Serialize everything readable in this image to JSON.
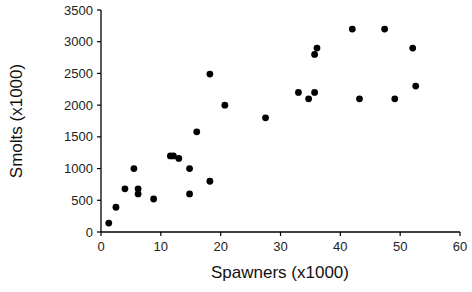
{
  "chart_data": {
    "type": "scatter",
    "title": "",
    "xlabel": "Spawners (x1000)",
    "ylabel": "Smolts (x1000)",
    "xlim": [
      0,
      60
    ],
    "ylim": [
      0,
      3500
    ],
    "xticks": [
      0,
      10,
      20,
      30,
      40,
      50,
      60
    ],
    "yticks": [
      0,
      500,
      1000,
      1500,
      2000,
      2500,
      3000,
      3500
    ],
    "grid": false,
    "legend": null,
    "marker_color": "#000000",
    "series": [
      {
        "name": "Smolts vs Spawners",
        "points": [
          {
            "x": 1.3,
            "y": 140
          },
          {
            "x": 2.5,
            "y": 390
          },
          {
            "x": 4.0,
            "y": 680
          },
          {
            "x": 5.5,
            "y": 1000
          },
          {
            "x": 6.2,
            "y": 680
          },
          {
            "x": 6.2,
            "y": 600
          },
          {
            "x": 8.8,
            "y": 520
          },
          {
            "x": 11.6,
            "y": 1200
          },
          {
            "x": 12.1,
            "y": 1200
          },
          {
            "x": 13.0,
            "y": 1160
          },
          {
            "x": 14.8,
            "y": 1000
          },
          {
            "x": 14.8,
            "y": 600
          },
          {
            "x": 16.0,
            "y": 1580
          },
          {
            "x": 18.2,
            "y": 2490
          },
          {
            "x": 18.2,
            "y": 800
          },
          {
            "x": 20.7,
            "y": 2000
          },
          {
            "x": 27.5,
            "y": 1800
          },
          {
            "x": 33.0,
            "y": 2200
          },
          {
            "x": 34.7,
            "y": 2100
          },
          {
            "x": 35.7,
            "y": 2200
          },
          {
            "x": 35.7,
            "y": 2800
          },
          {
            "x": 36.1,
            "y": 2900
          },
          {
            "x": 42.0,
            "y": 3200
          },
          {
            "x": 43.2,
            "y": 2100
          },
          {
            "x": 47.4,
            "y": 3200
          },
          {
            "x": 49.1,
            "y": 2100
          },
          {
            "x": 52.1,
            "y": 2900
          },
          {
            "x": 52.6,
            "y": 2300
          }
        ]
      }
    ]
  },
  "axes": {
    "x_title": "Spawners (x1000)",
    "y_title": "Smolts (x1000)"
  }
}
